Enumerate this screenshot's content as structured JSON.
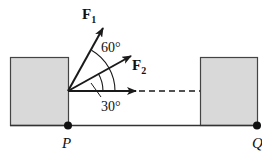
{
  "diagram": {
    "type": "force-diagram",
    "forces": [
      {
        "name": "F",
        "subscript": "1",
        "angle_deg_from_horizontal": 60
      },
      {
        "name": "F",
        "subscript": "2",
        "angle_deg_from_horizontal": 30
      }
    ],
    "angles": {
      "between_F1_and_F2": "60°",
      "between_F2_and_horizontal": "30°"
    },
    "points": {
      "left": "P",
      "right": "Q"
    },
    "colors": {
      "box_fill": "#d9d9d9",
      "stroke": "#1a1a1a",
      "background": "#ffffff"
    }
  }
}
